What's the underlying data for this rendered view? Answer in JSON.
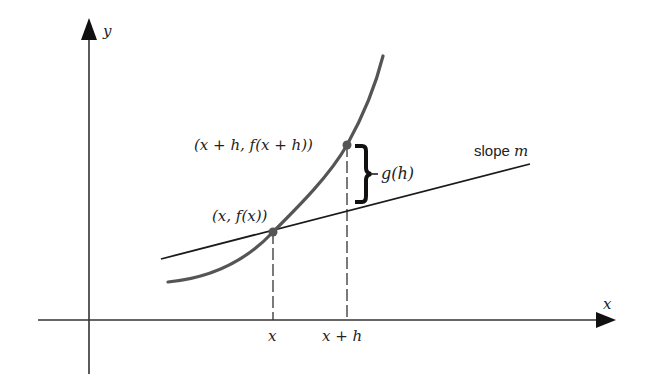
{
  "diagram": {
    "axes": {
      "x_label": "x",
      "y_label": "y"
    },
    "points": {
      "p1_label": "(x, f(x))",
      "p2_label": "(x + h, f(x + h))"
    },
    "ticks": {
      "x1": "x",
      "x2": "x + h"
    },
    "brace_label": "g(h)",
    "line_label_prefix": "slope ",
    "line_label_var": "m",
    "colors": {
      "curve": "#555555",
      "line": "#1a1a1a",
      "axis": "#333333",
      "point": "#555555"
    }
  }
}
